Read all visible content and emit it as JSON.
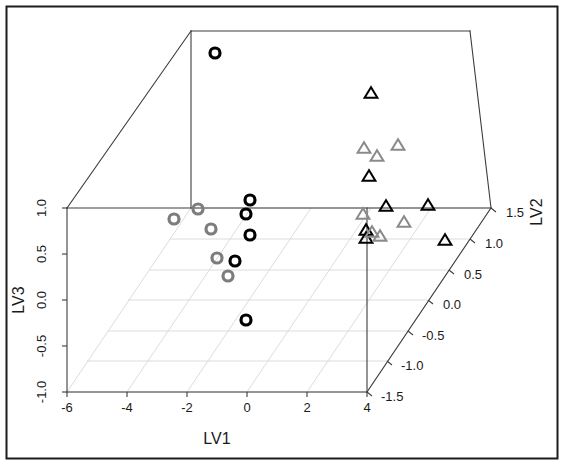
{
  "chart_data": {
    "type": "scatter",
    "projection": "3d",
    "title": "",
    "xlabel": "LV1",
    "ylabel": "LV2",
    "zlabel": "LV3",
    "xlim": [
      -6,
      4
    ],
    "ylim": [
      -1.5,
      1.5
    ],
    "zlim": [
      -1,
      1
    ],
    "xticks": [
      "-6",
      "-4",
      "-2",
      "0",
      "2",
      "4"
    ],
    "xtick_values": [
      -6,
      -4,
      -2,
      0,
      2,
      4
    ],
    "yticks": [
      "1.5",
      "1.0",
      "0.5",
      "0.0",
      "-0.5",
      "-1.0",
      "-1.5"
    ],
    "ytick_values": [
      1.5,
      1.0,
      0.5,
      0.0,
      -0.5,
      -1.0,
      -1.5
    ],
    "zticks": [
      "1.0",
      "0.5",
      "0.0",
      "-0.5",
      "-1.0"
    ],
    "ztick_values": [
      1.0,
      0.5,
      0.0,
      -0.5,
      -1.0
    ],
    "grid": true,
    "grid_color": "#d8d8d8",
    "box_color": "#3c3c3c",
    "legend": null,
    "legend_position": "none",
    "series": [
      {
        "name": "black-circles",
        "marker": "circle",
        "color": "#000000",
        "filled": false,
        "points": [
          {
            "px": 215,
            "py": 53,
            "label": "p1"
          },
          {
            "px": 250,
            "py": 200,
            "label": "p2"
          },
          {
            "px": 246,
            "py": 214,
            "label": "p3"
          },
          {
            "px": 250,
            "py": 235,
            "label": "p4"
          },
          {
            "px": 235,
            "py": 261,
            "label": "p5"
          },
          {
            "px": 246,
            "py": 320,
            "label": "p6"
          }
        ]
      },
      {
        "name": "gray-circles",
        "marker": "circle",
        "color": "#7d7d7d",
        "filled": false,
        "points": [
          {
            "px": 174,
            "py": 219,
            "label": "g1"
          },
          {
            "px": 198,
            "py": 209,
            "label": "g2"
          },
          {
            "px": 211,
            "py": 229,
            "label": "g3"
          },
          {
            "px": 217,
            "py": 258,
            "label": "g4"
          },
          {
            "px": 228,
            "py": 276,
            "label": "g5"
          }
        ]
      },
      {
        "name": "black-triangles",
        "marker": "triangle",
        "color": "#000000",
        "filled": false,
        "points": [
          {
            "px": 371,
            "py": 93,
            "label": "t1"
          },
          {
            "px": 369,
            "py": 176,
            "label": "t2"
          },
          {
            "px": 386,
            "py": 206,
            "label": "t3"
          },
          {
            "px": 428,
            "py": 205,
            "label": "t4"
          },
          {
            "px": 366,
            "py": 230,
            "label": "t5"
          },
          {
            "px": 366,
            "py": 238,
            "label": "t6"
          },
          {
            "px": 445,
            "py": 240,
            "label": "t7"
          }
        ]
      },
      {
        "name": "gray-triangles",
        "marker": "triangle",
        "color": "#8a8a8a",
        "filled": false,
        "points": [
          {
            "px": 364,
            "py": 148,
            "label": "s1"
          },
          {
            "px": 377,
            "py": 156,
            "label": "s2"
          },
          {
            "px": 398,
            "py": 145,
            "label": "s3"
          },
          {
            "px": 363,
            "py": 214,
            "label": "s4"
          },
          {
            "px": 404,
            "py": 222,
            "label": "s5"
          },
          {
            "px": 380,
            "py": 236,
            "label": "s6"
          },
          {
            "px": 372,
            "py": 232,
            "label": "s7"
          }
        ]
      }
    ]
  },
  "axes": {
    "x_title": "LV1",
    "y_title": "LV2",
    "z_title": "LV3",
    "x_ticks": [
      {
        "text": "-6",
        "px": 68,
        "py": 406
      },
      {
        "text": "-4",
        "px": 128,
        "py": 406
      },
      {
        "text": "-2",
        "px": 188,
        "py": 406
      },
      {
        "text": "0",
        "px": 248,
        "py": 406
      },
      {
        "text": "2",
        "px": 308,
        "py": 406
      },
      {
        "text": "4",
        "px": 367,
        "py": 406
      }
    ],
    "y_ticks": [
      {
        "text": "1.5",
        "px": 489,
        "py": 209
      },
      {
        "text": "1.0",
        "px": 489,
        "py": 240
      },
      {
        "text": "0.5",
        "px": 477,
        "py": 270
      },
      {
        "text": "0.0",
        "px": 465,
        "py": 300
      },
      {
        "text": "-0.5",
        "px": 455,
        "py": 331
      },
      {
        "text": "-1.0",
        "px": 443,
        "py": 361
      },
      {
        "text": "-1.5",
        "px": 431,
        "py": 392
      }
    ],
    "z_ticks": [
      {
        "text": "1.0",
        "px": 46,
        "py": 208
      },
      {
        "text": "0.5",
        "px": 46,
        "py": 254
      },
      {
        "text": "0.0",
        "px": 46,
        "py": 300
      },
      {
        "text": "-0.5",
        "px": 46,
        "py": 346
      },
      {
        "text": "-1.0",
        "px": 46,
        "py": 392
      }
    ]
  },
  "frame": {
    "border_color": "#1c1c1c",
    "background": "#ffffff"
  }
}
